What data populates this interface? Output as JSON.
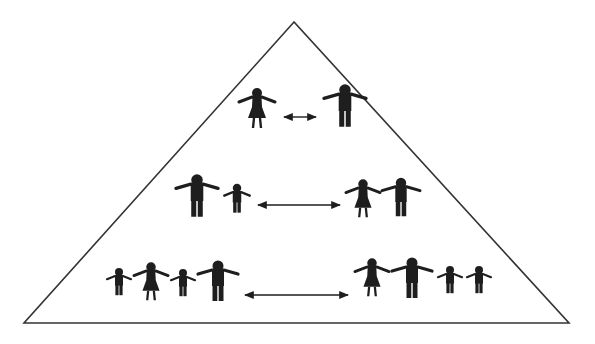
{
  "diagram": {
    "type": "pyramid",
    "colors": {
      "stroke": "#333333",
      "figure": "#1e1e1e",
      "background": "#ffffff"
    },
    "triangle": {
      "apex": [
        294,
        22
      ],
      "base_left": [
        24,
        323
      ],
      "base_right": [
        569,
        323
      ]
    },
    "tiers": [
      {
        "name": "tier-1",
        "left_group": [
          {
            "kind": "female",
            "x": 257,
            "y": 93,
            "s": 1.0
          }
        ],
        "right_group": [
          {
            "kind": "male",
            "x": 345,
            "y": 90,
            "s": 1.05
          }
        ],
        "arrow": {
          "x1": 284,
          "x2": 316,
          "y": 117
        }
      },
      {
        "name": "tier-2",
        "left_group": [
          {
            "kind": "male",
            "x": 197,
            "y": 180,
            "s": 1.05
          },
          {
            "kind": "child",
            "x": 237,
            "y": 188,
            "s": 0.85
          }
        ],
        "right_group": [
          {
            "kind": "female",
            "x": 363,
            "y": 184,
            "s": 0.95
          },
          {
            "kind": "male",
            "x": 401,
            "y": 183,
            "s": 0.95
          }
        ],
        "arrow": {
          "x1": 258,
          "x2": 340,
          "y": 205
        }
      },
      {
        "name": "tier-3",
        "left_group": [
          {
            "kind": "child",
            "x": 119,
            "y": 272,
            "s": 0.8
          },
          {
            "kind": "female",
            "x": 151,
            "y": 267,
            "s": 0.95
          },
          {
            "kind": "child",
            "x": 183,
            "y": 273,
            "s": 0.8
          },
          {
            "kind": "male",
            "x": 218,
            "y": 266,
            "s": 1.0
          }
        ],
        "right_group": [
          {
            "kind": "female",
            "x": 372,
            "y": 263,
            "s": 0.95
          },
          {
            "kind": "male",
            "x": 412,
            "y": 263,
            "s": 1.0
          },
          {
            "kind": "child",
            "x": 450,
            "y": 270,
            "s": 0.8
          },
          {
            "kind": "child",
            "x": 479,
            "y": 270,
            "s": 0.8
          }
        ],
        "arrow": {
          "x1": 245,
          "x2": 348,
          "y": 295
        }
      }
    ]
  }
}
